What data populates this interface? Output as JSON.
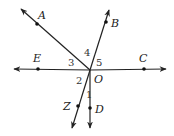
{
  "diagram": {
    "center": {
      "name": "O",
      "x": 90,
      "y": 70
    },
    "rays": [
      {
        "id": "OA",
        "point_label": "A",
        "point": [
          37,
          24
        ],
        "tip": [
          21,
          9
        ],
        "label_pos": [
          38,
          19
        ]
      },
      {
        "id": "OB",
        "point_label": "B",
        "point": [
          106,
          22
        ],
        "tip": [
          109,
          10
        ],
        "label_pos": [
          111,
          27
        ]
      },
      {
        "id": "OC",
        "point_label": "C",
        "point": [
          144,
          69
        ],
        "tip": [
          166,
          69
        ],
        "label_pos": [
          139,
          62
        ]
      },
      {
        "id": "OE",
        "point_label": "E",
        "point": [
          38,
          69
        ],
        "tip": [
          14,
          69
        ],
        "label_pos": [
          33,
          62
        ]
      },
      {
        "id": "OZ",
        "point_label": "Z",
        "point": [
          78,
          106
        ],
        "tip": [
          72,
          128
        ],
        "label_pos": [
          63,
          110
        ]
      },
      {
        "id": "OD",
        "point_label": "D",
        "point": [
          90,
          108
        ],
        "tip": [
          90,
          128
        ],
        "label_pos": [
          95,
          113
        ]
      }
    ],
    "angle_labels": [
      {
        "label": "1",
        "x": 86,
        "y": 98
      },
      {
        "label": "2",
        "x": 76,
        "y": 84
      },
      {
        "label": "3",
        "x": 68,
        "y": 66
      },
      {
        "label": "4",
        "x": 84,
        "y": 56
      },
      {
        "label": "5",
        "x": 96,
        "y": 66
      }
    ],
    "center_label": {
      "label": "O",
      "x": 94,
      "y": 83
    }
  }
}
